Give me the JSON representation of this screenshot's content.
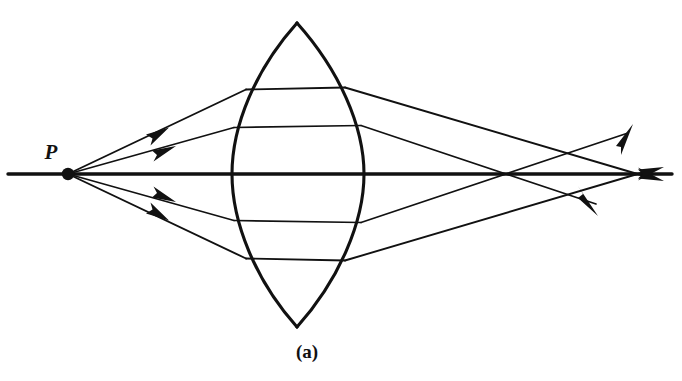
{
  "figure": {
    "caption": "(a)",
    "background_color": "#ffffff",
    "ink_color": "#111111"
  },
  "labels": {
    "source_point": "P",
    "source_point_desc": "object point on the optic axis",
    "caption": "(a)"
  },
  "geometry": {
    "canvas": {
      "width": 682,
      "height": 381
    },
    "source_point": {
      "x": 68,
      "y": 174,
      "dot_radius": 6.2
    },
    "optic_axis": {
      "x1": 8,
      "y1": 174,
      "x2": 672,
      "y2": 174
    },
    "lens": {
      "type": "biconvex",
      "top_apex": {
        "x": 297,
        "y": 23
      },
      "bottom_apex": {
        "x": 297,
        "y": 327
      },
      "left_surface_vertex": {
        "x": 232,
        "y": 174
      },
      "right_surface_vertex": {
        "x": 364,
        "y": 174
      },
      "center_thickness": 132,
      "aperture_height": 304
    },
    "focus_crossings": [
      {
        "name": "marginal-ray-focus",
        "x": 525,
        "y": 174
      },
      {
        "name": "paraxial-ray-focus",
        "x": 588,
        "y": 174
      }
    ]
  },
  "rays": [
    {
      "id": "upper-marginal-ray",
      "desc": "outer upper ray from P, refracted twice, crosses axis nearest the lens",
      "incident": {
        "from": [
          68,
          174
        ],
        "to": [
          245,
          90
        ]
      },
      "inside": {
        "from": [
          245,
          90
        ],
        "to": [
          345,
          88
        ]
      },
      "exit": {
        "from": [
          345,
          88
        ],
        "to": [
          640,
          175
        ]
      },
      "arrow_on_incident": {
        "x": 160,
        "y": 133,
        "angle_deg": -25
      },
      "terminal_arrow": {
        "x": 648,
        "y": 177,
        "angle_deg": 17
      }
    },
    {
      "id": "upper-paraxial-ray",
      "desc": "inner upper ray from P, refracted twice, crosses axis farther from the lens",
      "incident": {
        "from": [
          68,
          174
        ],
        "to": [
          234,
          128
        ]
      },
      "inside": {
        "from": [
          234,
          128
        ],
        "to": [
          360,
          126
        ]
      },
      "exit": {
        "from": [
          360,
          126
        ],
        "to": [
          625,
          207
        ]
      },
      "arrow_on_incident": {
        "x": 168,
        "y": 150,
        "angle_deg": -15
      },
      "terminal_arrow": {
        "x": 592,
        "y": 209,
        "angle_deg": 17
      }
    },
    {
      "id": "lower-marginal-ray",
      "desc": "outer lower ray from P, mirror of the upper marginal ray",
      "incident": {
        "from": [
          68,
          174
        ],
        "to": [
          245,
          258
        ]
      },
      "inside": {
        "from": [
          245,
          258
        ],
        "to": [
          345,
          261
        ]
      },
      "exit": {
        "from": [
          345,
          261
        ],
        "to": [
          640,
          173
        ]
      },
      "arrow_on_incident": {
        "x": 160,
        "y": 215,
        "angle_deg": 25
      },
      "terminal_arrow": {
        "x": 648,
        "y": 171,
        "angle_deg": -17
      }
    },
    {
      "id": "lower-paraxial-ray",
      "desc": "inner lower ray from P, mirror of the upper paraxial ray",
      "incident": {
        "from": [
          68,
          174
        ],
        "to": [
          234,
          220
        ]
      },
      "inside": {
        "from": [
          234,
          220
        ],
        "to": [
          360,
          222
        ]
      },
      "exit": {
        "from": [
          360,
          222
        ],
        "to": [
          625,
          141
        ]
      },
      "arrow_on_incident": {
        "x": 168,
        "y": 198,
        "angle_deg": 15
      },
      "terminal_arrow": {
        "x": 628,
        "y": 139,
        "angle_deg": -17
      }
    }
  ]
}
